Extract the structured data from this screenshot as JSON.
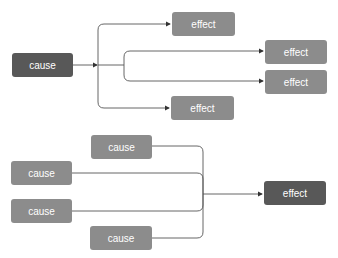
{
  "colors": {
    "dark_node": "#585858",
    "light_node": "#8c8c8c",
    "line": "#444444"
  },
  "diagram1": {
    "title": "one cause, multiple effects",
    "cause": {
      "label": "cause"
    },
    "effects": [
      {
        "label": "effect"
      },
      {
        "label": "effect"
      },
      {
        "label": "effect"
      },
      {
        "label": "effect"
      }
    ]
  },
  "diagram2": {
    "title": "multiple causes, one effect",
    "causes": [
      {
        "label": "cause"
      },
      {
        "label": "cause"
      },
      {
        "label": "cause"
      },
      {
        "label": "cause"
      }
    ],
    "effect": {
      "label": "effect"
    }
  }
}
